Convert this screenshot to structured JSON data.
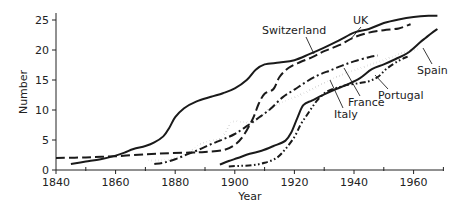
{
  "chart_data": {
    "type": "line",
    "title": "",
    "xlabel": "Year",
    "ylabel": "Number",
    "xlim": [
      1840,
      1970
    ],
    "ylim": [
      0,
      25
    ],
    "x_ticks": [
      1840,
      1860,
      1880,
      1900,
      1920,
      1940,
      1960
    ],
    "x_minor_ticks": [
      1850,
      1870,
      1890,
      1910,
      1930,
      1950,
      1970
    ],
    "y_ticks": [
      0,
      5,
      10,
      15,
      20,
      25
    ],
    "grid": false,
    "legend": "direct labels with leader lines",
    "series": [
      {
        "name": "UK",
        "style": "solid",
        "points": [
          [
            1845,
            1.0
          ],
          [
            1850,
            1.4
          ],
          [
            1855,
            1.8
          ],
          [
            1860,
            2.4
          ],
          [
            1863,
            2.9
          ],
          [
            1866,
            3.5
          ],
          [
            1870,
            4.0
          ],
          [
            1873,
            4.6
          ],
          [
            1876,
            5.6
          ],
          [
            1878,
            7.0
          ],
          [
            1880,
            8.8
          ],
          [
            1883,
            10.3
          ],
          [
            1887,
            11.4
          ],
          [
            1892,
            12.2
          ],
          [
            1896,
            12.8
          ],
          [
            1900,
            13.6
          ],
          [
            1904,
            15.0
          ],
          [
            1907,
            16.7
          ],
          [
            1910,
            17.6
          ],
          [
            1915,
            17.9
          ],
          [
            1920,
            18.3
          ],
          [
            1925,
            19.3
          ],
          [
            1930,
            20.4
          ],
          [
            1935,
            21.6
          ],
          [
            1940,
            22.9
          ],
          [
            1945,
            23.5
          ],
          [
            1950,
            24.5
          ],
          [
            1955,
            25.1
          ],
          [
            1960,
            25.5
          ],
          [
            1965,
            25.7
          ],
          [
            1968,
            25.7
          ]
        ]
      },
      {
        "name": "Switzerland",
        "style": "dashed",
        "points": [
          [
            1840,
            2.0
          ],
          [
            1850,
            2.1
          ],
          [
            1860,
            2.3
          ],
          [
            1870,
            2.6
          ],
          [
            1878,
            2.8
          ],
          [
            1885,
            2.9
          ],
          [
            1890,
            3.0
          ],
          [
            1896,
            3.3
          ],
          [
            1900,
            4.2
          ],
          [
            1903,
            5.8
          ],
          [
            1906,
            8.5
          ],
          [
            1908,
            11.0
          ],
          [
            1910,
            12.7
          ],
          [
            1913,
            13.5
          ],
          [
            1915,
            15.5
          ],
          [
            1918,
            17.0
          ],
          [
            1922,
            18.0
          ],
          [
            1926,
            18.8
          ],
          [
            1930,
            19.8
          ],
          [
            1935,
            20.8
          ],
          [
            1940,
            22.1
          ],
          [
            1945,
            22.9
          ],
          [
            1950,
            23.3
          ],
          [
            1955,
            23.6
          ],
          [
            1959,
            24.3
          ]
        ]
      },
      {
        "name": "France",
        "style": "dash-dot",
        "points": [
          [
            1873,
            1.0
          ],
          [
            1876,
            1.2
          ],
          [
            1880,
            1.8
          ],
          [
            1884,
            2.6
          ],
          [
            1888,
            3.4
          ],
          [
            1892,
            4.3
          ],
          [
            1896,
            5.1
          ],
          [
            1900,
            6.0
          ],
          [
            1904,
            7.3
          ],
          [
            1908,
            8.7
          ],
          [
            1912,
            10.2
          ],
          [
            1916,
            12.1
          ],
          [
            1920,
            13.4
          ],
          [
            1924,
            14.7
          ],
          [
            1928,
            15.8
          ],
          [
            1932,
            16.6
          ],
          [
            1936,
            17.4
          ],
          [
            1940,
            18.1
          ],
          [
            1945,
            18.8
          ],
          [
            1948,
            19.1
          ]
        ]
      },
      {
        "name": "Italy",
        "style": "dotted",
        "points": [
          [
            1871,
            1.6
          ],
          [
            1876,
            1.6
          ],
          [
            1880,
            2.0
          ],
          [
            1884,
            2.8
          ],
          [
            1888,
            4.2
          ],
          [
            1892,
            4.9
          ],
          [
            1895,
            5.2
          ],
          [
            1897,
            6.5
          ],
          [
            1899,
            8.0
          ],
          [
            1903,
            8.0
          ],
          [
            1906,
            7.8
          ],
          [
            1909,
            8.9
          ],
          [
            1912,
            10.3
          ],
          [
            1916,
            11.3
          ],
          [
            1920,
            12.1
          ],
          [
            1924,
            13.0
          ],
          [
            1928,
            14.0
          ],
          [
            1932,
            15.0
          ],
          [
            1936,
            15.9
          ],
          [
            1940,
            16.6
          ],
          [
            1945,
            17.5
          ],
          [
            1950,
            18.3
          ],
          [
            1955,
            19.3
          ],
          [
            1960,
            20.0
          ],
          [
            1962,
            20.3
          ]
        ]
      },
      {
        "name": "Portugal",
        "style": "dash-dot-dot",
        "points": [
          [
            1898,
            0.6
          ],
          [
            1902,
            0.7
          ],
          [
            1906,
            0.8
          ],
          [
            1910,
            1.2
          ],
          [
            1914,
            2.0
          ],
          [
            1917,
            3.5
          ],
          [
            1920,
            5.5
          ],
          [
            1922,
            7.5
          ],
          [
            1924,
            9.0
          ],
          [
            1926,
            10.5
          ],
          [
            1928,
            11.8
          ],
          [
            1931,
            13.1
          ],
          [
            1935,
            13.8
          ],
          [
            1938,
            14.2
          ],
          [
            1942,
            14.5
          ],
          [
            1945,
            14.8
          ],
          [
            1948,
            15.5
          ],
          [
            1951,
            16.9
          ],
          [
            1955,
            18.2
          ],
          [
            1958,
            18.9
          ]
        ]
      },
      {
        "name": "Spain",
        "style": "solid",
        "points": [
          [
            1895,
            0.9
          ],
          [
            1898,
            1.5
          ],
          [
            1901,
            2.0
          ],
          [
            1905,
            2.7
          ],
          [
            1909,
            3.2
          ],
          [
            1913,
            4.0
          ],
          [
            1917,
            4.9
          ],
          [
            1919,
            6.3
          ],
          [
            1921,
            8.7
          ],
          [
            1923,
            10.8
          ],
          [
            1926,
            11.6
          ],
          [
            1930,
            12.6
          ],
          [
            1934,
            13.5
          ],
          [
            1938,
            14.3
          ],
          [
            1942,
            15.3
          ],
          [
            1946,
            16.8
          ],
          [
            1950,
            17.6
          ],
          [
            1954,
            18.5
          ],
          [
            1958,
            19.5
          ],
          [
            1962,
            21.2
          ],
          [
            1964,
            22.0
          ],
          [
            1966,
            22.8
          ],
          [
            1968,
            23.5
          ]
        ]
      }
    ],
    "labels": [
      {
        "name": "UK",
        "text": "UK",
        "x": 360,
        "y": 23,
        "leader_from": [
          362,
          26
        ],
        "leader_to": [
          352,
          38
        ]
      },
      {
        "name": "Switzerland",
        "text": "Switzerland",
        "x": 262,
        "y": 33,
        "leader_from": [
          310,
          37
        ],
        "leader_to": [
          315,
          53
        ]
      },
      {
        "name": "Spain",
        "text": "Spain",
        "x": 433,
        "y": 115,
        "leader_from": [
          437,
          103
        ],
        "leader_to": [
          424,
          67
        ]
      },
      {
        "name": "Portugal",
        "text": "Portugal",
        "x": 388,
        "y": 97,
        "leader_from": [
          395,
          88
        ],
        "leader_to": [
          376,
          74
        ]
      },
      {
        "name": "France",
        "text": "France",
        "x": 347,
        "y": 103,
        "leader_from": [
          357,
          92
        ],
        "leader_to": [
          340,
          67
        ]
      },
      {
        "name": "Italy",
        "text": "Italy",
        "x": 333,
        "y": 116,
        "leader_from": [
          336,
          106
        ],
        "leader_to": [
          327,
          79
        ]
      }
    ]
  },
  "axes": {
    "ylabel": "Number",
    "xlabel": "Year",
    "x_tick_labels": [
      "1840",
      "1860",
      "1880",
      "1900",
      "1920",
      "1940",
      "1960"
    ],
    "y_tick_labels": [
      "0",
      "5",
      "10",
      "15",
      "20",
      "25"
    ]
  },
  "series_labels": {
    "uk": "UK",
    "switzerland": "Switzerland",
    "spain": "Spain",
    "portugal": "Portugal",
    "france": "France",
    "italy": "Italy"
  }
}
